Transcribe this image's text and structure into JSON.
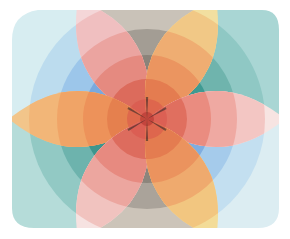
{
  "artwork": {
    "description": "Abstract painting: concentric circles overlaid with a six-petal rosette",
    "background": "#ffffff",
    "quadrants": [
      {
        "name": "upper-left",
        "colors": [
          "#d7edf1",
          "#bcdcee",
          "#9cc6ea",
          "#7aa9de",
          "#4f86cc"
        ]
      },
      {
        "name": "top",
        "colors": [
          "#efe6da",
          "#c9c2b8",
          "#a39d94",
          "#8a837a",
          "#6e665e"
        ]
      },
      {
        "name": "upper-right",
        "colors": [
          "#a9d6d4",
          "#8fc8c4",
          "#6fb4ad",
          "#3f9a92",
          "#1f7a72"
        ]
      },
      {
        "name": "lower-left",
        "colors": [
          "#b5dcd9",
          "#92c9c4",
          "#6db3ad",
          "#3e958d",
          "#1e766e"
        ]
      },
      {
        "name": "bottom",
        "colors": [
          "#ede5d9",
          "#ccc4b9",
          "#aaa39a",
          "#8c857c",
          "#6f675f"
        ]
      },
      {
        "name": "lower-right",
        "colors": [
          "#dcedf2",
          "#c3dff0",
          "#a5cbeb",
          "#80ade0",
          "#5288cf"
        ]
      }
    ],
    "petals": [
      {
        "name": "petal-upper-left",
        "angle": -120,
        "colors": [
          "#f4d6d8",
          "#f0bfc0",
          "#eba4a0",
          "#e58a80",
          "#dc6b5c"
        ]
      },
      {
        "name": "petal-upper-right",
        "angle": -60,
        "colors": [
          "#f2dfa0",
          "#f1c886",
          "#efad72",
          "#eb9560",
          "#e47c50"
        ]
      },
      {
        "name": "petal-left",
        "angle": 180,
        "colors": [
          "#f2c58a",
          "#f2b678",
          "#f0a467",
          "#ed925a",
          "#e5804e"
        ]
      },
      {
        "name": "petal-right",
        "angle": 0,
        "colors": [
          "#f7e4e2",
          "#f3c6c3",
          "#efa9a2",
          "#ea8c80",
          "#e06f5f"
        ]
      },
      {
        "name": "petal-lower-left",
        "angle": 120,
        "colors": [
          "#f6e2e1",
          "#f1c3bf",
          "#eca69f",
          "#e78a80",
          "#dd6c5e"
        ]
      },
      {
        "name": "petal-lower-right",
        "angle": 60,
        "colors": [
          "#f3dc98",
          "#f2c680",
          "#efaa6e",
          "#eb935e",
          "#e47c50"
        ]
      }
    ],
    "center": {
      "colors": [
        "#d9544a",
        "#b93a35",
        "#222222"
      ]
    }
  }
}
